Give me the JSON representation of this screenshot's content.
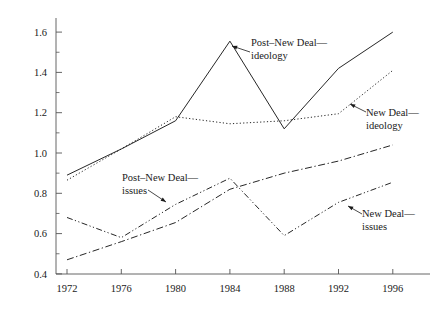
{
  "chart_data": {
    "type": "line",
    "title": "",
    "xlabel": "",
    "ylabel": "",
    "x": [
      1972,
      1976,
      1980,
      1984,
      1988,
      1992,
      1996
    ],
    "categories": [
      "1972",
      "1976",
      "1980",
      "1984",
      "1988",
      "1992",
      "1996"
    ],
    "xlim": [
      1970,
      1998
    ],
    "ylim": [
      0.4,
      1.68
    ],
    "yticks": [
      0.4,
      0.6,
      0.8,
      1.0,
      1.2,
      1.4,
      1.6
    ],
    "ytick_labels": [
      "0.4",
      "0.6",
      "0.8",
      "1.0",
      "1.2",
      "1.4",
      "1.6"
    ],
    "xtick_labels": [
      "1972",
      "1976",
      "1980",
      "1984",
      "1988",
      "1992",
      "1996"
    ],
    "grid": false,
    "legend": "annotations",
    "minor_y_ticks": [
      0.5,
      0.7,
      0.9,
      1.1,
      1.3,
      1.5
    ],
    "series": [
      {
        "name": "Post-New Deal—ideology",
        "style": "solid",
        "values": [
          0.89,
          1.02,
          1.16,
          1.555,
          1.12,
          1.42,
          1.6
        ]
      },
      {
        "name": "New Deal—ideology",
        "style": "dotted",
        "values": [
          0.865,
          1.02,
          1.18,
          1.145,
          1.16,
          1.195,
          1.41
        ]
      },
      {
        "name": "Post-New Deal—issues",
        "style": "dash-dot",
        "values": [
          0.47,
          0.56,
          0.655,
          0.82,
          0.9,
          0.96,
          1.04
        ]
      },
      {
        "name": "New Deal—issues",
        "style": "dash-dot-dot",
        "values": [
          0.68,
          0.58,
          0.745,
          0.875,
          0.59,
          0.755,
          0.855
        ]
      }
    ],
    "annotations": [
      {
        "id": "post-new-deal-ideology",
        "line1": "Post–New Deal—",
        "line2": "ideology",
        "text_x": 251,
        "text_y": 37,
        "arrow_from_x": 250,
        "arrow_from_y": 52,
        "arrow_to_x": 232,
        "arrow_to_y": 46
      },
      {
        "id": "new-deal-ideology",
        "line1": "New Deal—",
        "line2": "ideology",
        "text_x": 366,
        "text_y": 107,
        "arrow_from_x": 366,
        "arrow_from_y": 112,
        "arrow_to_x": 350,
        "arrow_to_y": 104
      },
      {
        "id": "post-new-deal-issues",
        "line1": "Post–New Deal—",
        "line2": "issues",
        "text_x": 122,
        "text_y": 172,
        "arrow_from_x": 148,
        "arrow_from_y": 190,
        "arrow_to_x": 166,
        "arrow_to_y": 202
      },
      {
        "id": "new-deal-issues",
        "line1": "New Deal—",
        "line2": "issues",
        "text_x": 362,
        "text_y": 208,
        "arrow_from_x": 362,
        "arrow_from_y": 214,
        "arrow_to_x": 348,
        "arrow_to_y": 206
      }
    ],
    "colors": {
      "axis": "#555555",
      "line": "#1a1a1a",
      "text": "#1a1a1a",
      "background": "#ffffff"
    }
  }
}
